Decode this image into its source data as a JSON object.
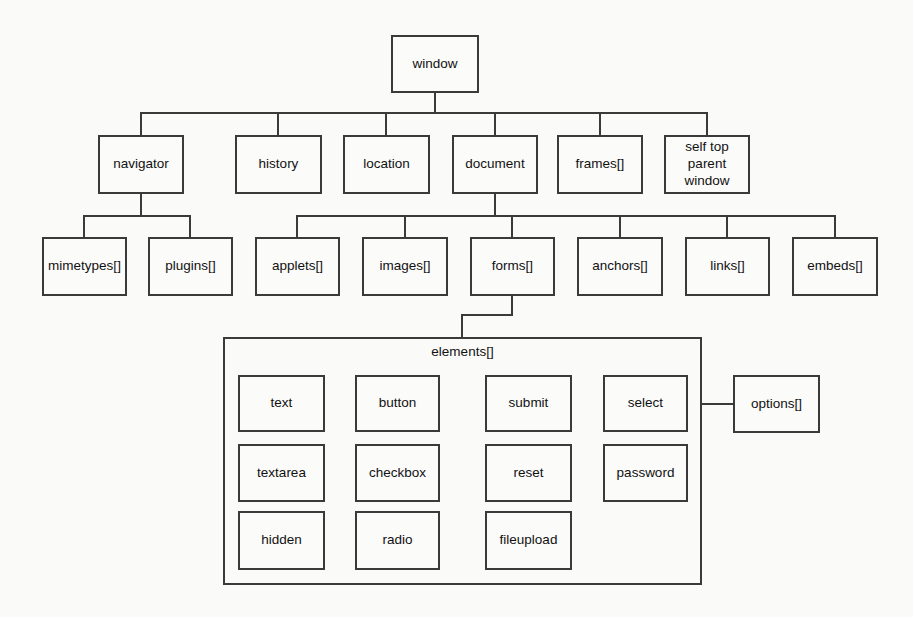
{
  "diagram": {
    "type": "hierarchy-tree",
    "root": {
      "label": "window"
    },
    "level2": [
      {
        "label": "navigator"
      },
      {
        "label": "history"
      },
      {
        "label": "location"
      },
      {
        "label": "document"
      },
      {
        "label": "frames[]"
      },
      {
        "label": "self top parent window"
      }
    ],
    "navigator_children": [
      {
        "label": "mimetypes[]"
      },
      {
        "label": "plugins[]"
      }
    ],
    "document_children": [
      {
        "label": "applets[]"
      },
      {
        "label": "images[]"
      },
      {
        "label": "forms[]"
      },
      {
        "label": "anchors[]"
      },
      {
        "label": "links[]"
      },
      {
        "label": "embeds[]"
      }
    ],
    "elements_container": {
      "label": "elements[]"
    },
    "elements_rows": [
      [
        "text",
        "button",
        "submit",
        "select"
      ],
      [
        "textarea",
        "checkbox",
        "reset",
        "password"
      ],
      [
        "hidden",
        "radio",
        "fileupload"
      ]
    ],
    "select_children": [
      {
        "label": "options[]"
      }
    ],
    "colors": {
      "line": "#3a3a3a",
      "background": "#fafaf8",
      "text": "#111111"
    }
  }
}
